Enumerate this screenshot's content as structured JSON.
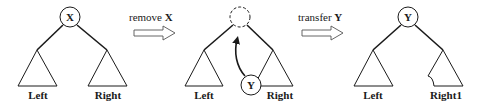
{
  "diagram": {
    "type": "binary-tree-deletion-steps",
    "colors": {
      "stroke": "#1a1a1a",
      "arrow_outline": "#555555",
      "background": "#ffffff"
    },
    "panels": [
      {
        "id": "before",
        "root": {
          "label": "X",
          "style": "solid"
        },
        "left_subtree": "Left",
        "right_subtree": "Right"
      },
      {
        "id": "during",
        "root": {
          "label": "",
          "style": "dashed-empty"
        },
        "left_subtree": "Left",
        "right_subtree": "Right",
        "moving_node": {
          "label": "Y",
          "from": "bottom-left of Right subtree",
          "to": "empty root"
        }
      },
      {
        "id": "after",
        "root": {
          "label": "Y",
          "style": "solid"
        },
        "left_subtree": "Left",
        "right_subtree": "Right1"
      }
    ],
    "transitions": [
      {
        "text": "remove ",
        "emphasis": "X"
      },
      {
        "text": "transfer ",
        "emphasis": "Y"
      }
    ]
  }
}
